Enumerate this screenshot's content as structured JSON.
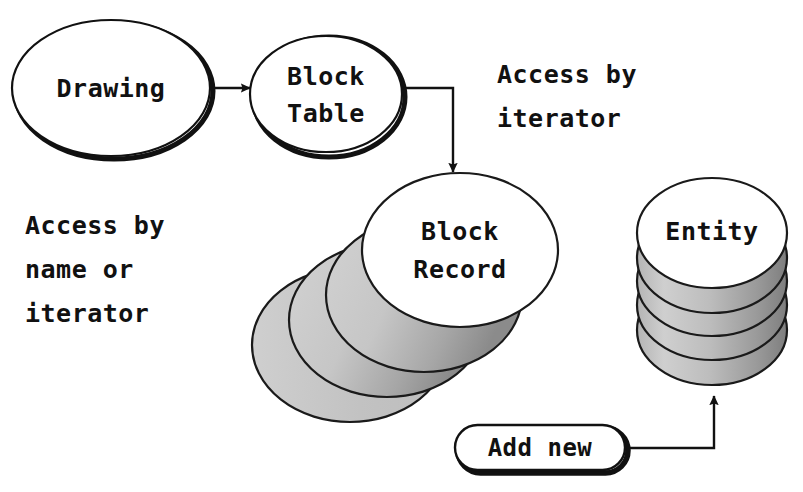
{
  "diagram": {
    "background_color": "#ffffff",
    "ink_color": "#111111",
    "stack_fill_color": "#c9c9c9",
    "stack_shade_color": "#8f8f8f",
    "nodes": {
      "drawing": {
        "label": "Drawing",
        "shape": "ellipse"
      },
      "block_table": {
        "label_line1": "Block",
        "label_line2": "Table",
        "shape": "ellipse"
      },
      "block_record": {
        "label_line1": "Block",
        "label_line2": "Record",
        "shape": "circle-stack-diagonal",
        "stack_count": 4
      },
      "entity": {
        "label": "Entity",
        "shape": "circle-stack-vertical",
        "stack_count": 5
      },
      "add_new": {
        "label": "Add new",
        "shape": "rounded-pill"
      }
    },
    "annotations": {
      "access_by_iterator": {
        "line1": "Access by",
        "line2": "iterator"
      },
      "access_by_name_or_iterator": {
        "line1": "Access by",
        "line2": "name or",
        "line3": "iterator"
      }
    },
    "connectors": [
      {
        "name": "drawing-to-block-table",
        "from": "drawing",
        "to": "block_table",
        "style": "straight-arrow"
      },
      {
        "name": "block-table-to-block-record",
        "from": "block_table",
        "to": "block_record",
        "style": "elbow-arrow"
      },
      {
        "name": "add-new-to-entity",
        "from": "add_new",
        "to": "entity",
        "style": "elbow-arrow"
      }
    ]
  }
}
